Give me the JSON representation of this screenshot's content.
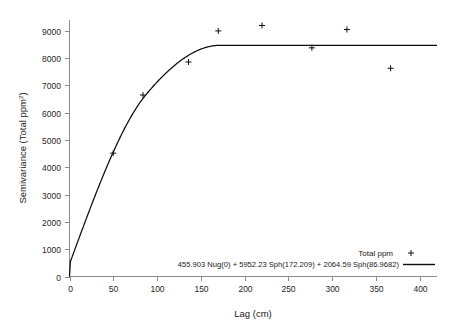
{
  "chart_data": {
    "type": "scatter",
    "title": "",
    "xlabel": "Lag (cm)",
    "ylabel": "Semivariance (Total ppm²)",
    "ylabel_base": "Semivariance (Total ppm",
    "ylabel_sup": "2",
    "ylabel_close": ")",
    "xlim": [
      0,
      420
    ],
    "ylim": [
      0,
      9400
    ],
    "xticks": [
      0,
      50,
      100,
      150,
      200,
      250,
      300,
      350,
      400
    ],
    "yticks": [
      0,
      1000,
      2000,
      3000,
      4000,
      5000,
      6000,
      7000,
      8000,
      9000
    ],
    "xtick_labels": [
      "0",
      "50",
      "100",
      "150",
      "200",
      "250",
      "300",
      "350",
      "400"
    ],
    "ytick_labels": [
      "0",
      "1000",
      "2000",
      "3000",
      "4000",
      "5000",
      "6000",
      "7000",
      "8000",
      "9000"
    ],
    "grid": false,
    "legend_position": "bottom-right",
    "series": [
      {
        "name": "Total ppm",
        "type": "scatter",
        "marker": "plus",
        "color": "#0d0d0d",
        "x": [
          50,
          84,
          136,
          170,
          220,
          277,
          317,
          367
        ],
        "y": [
          4520,
          6650,
          7860,
          9000,
          9200,
          8380,
          9050,
          7630
        ]
      },
      {
        "name": "455.903 Nug(0) + 5952.23 Sph(172.209) + 2064.59 Sph(86.9682)",
        "type": "line",
        "color": "#0d0d0d",
        "model": {
          "nugget": 455.903,
          "structures": [
            {
              "sill": 5952.23,
              "range": 172.209,
              "model": "Sph"
            },
            {
              "sill": 2064.59,
              "range": 86.9682,
              "model": "Sph"
            }
          ],
          "total_sill": 8472.723
        }
      }
    ]
  },
  "legend": {
    "entries": [
      {
        "label": "Total ppm",
        "symbol": "plus"
      },
      {
        "label": "455.903 Nug(0) + 5952.23 Sph(172.209) + 2064.59 Sph(86.9682)",
        "symbol": "line"
      }
    ]
  },
  "colors": {
    "background": "#ffffff",
    "axis": "#8c8c8c",
    "ink": "#0d0d0d",
    "text": "#1a1a1a"
  }
}
